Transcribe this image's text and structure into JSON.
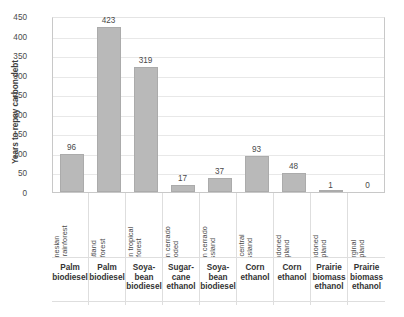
{
  "chart_data": {
    "type": "bar",
    "title": "",
    "subtitle": "",
    "xlabel": "",
    "ylabel": "Years to repay carbon debt",
    "ylim": [
      0,
      450
    ],
    "ytick_step": 50,
    "ytick_labels": [
      "450",
      "400",
      "350",
      "300",
      "250",
      "200",
      "150",
      "100",
      "50",
      "0"
    ],
    "grid": true,
    "legend": "none",
    "bar_color": "#b9b9b9",
    "categories": [
      "Indonesian tropical rainforest",
      "Indonesian peatland rainforest",
      "Brazilian tropical rainforest",
      "Brazilian cerrado wooded",
      "Brazilian cerrado grassland",
      "USA central grassland",
      "Abandoned cropland",
      "Abandoned cropland",
      "Marginal cropland"
    ],
    "group_labels": [
      "Palm biodiesel",
      "Palm biodiesel",
      "Soya-bean biodiesel",
      "Sugar-cane ethanol",
      "Soya-bean biodiesel",
      "Corn ethanol",
      "Corn ethanol",
      "Prairie biomass ethanol",
      "Prairie biomass ethanol"
    ],
    "values": [
      96,
      423,
      319,
      17,
      37,
      93,
      48,
      1,
      0
    ],
    "value_labels": [
      "96",
      "423",
      "319",
      "17",
      "37",
      "93",
      "48",
      "1",
      "0"
    ]
  },
  "axis": {
    "y_title": "Years to repay carbon debt"
  },
  "x_table": {
    "rows": [
      {
        "name": "land-type-row",
        "cells": [
          "Indonesian tropical rainforest",
          "Indonesian peatland rainforest",
          "Brazilian tropical rainforest",
          "Brazilian cerrado wooded",
          "Brazilian cerrado grassland",
          "USA central grassland",
          "Abandoned cropland",
          "Abandoned cropland",
          "Marginal cropland"
        ]
      },
      {
        "name": "fuel-type-row",
        "cells": [
          "Palm biodiesel",
          "Palm biodiesel",
          "Soya-bean biodiesel",
          "Sugar-cane ethanol",
          "Soya-bean biodiesel",
          "Corn ethanol",
          "Corn ethanol",
          "Prairie biomass ethanol",
          "Prairie biomass ethanol"
        ]
      }
    ]
  }
}
